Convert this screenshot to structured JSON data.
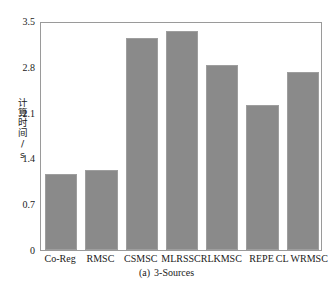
{
  "figure": {
    "caption_tag": "(a)",
    "caption_text": "3-Sources",
    "ylabel": "计算时间/s",
    "bar_color": "#8a8a8a",
    "frame_color": "#9a9a9a",
    "text_color": "#1a1a1a",
    "background": "#ffffff"
  },
  "chart_data": {
    "type": "bar",
    "title": "",
    "subtitle": "(a)  3-Sources",
    "xlabel": "",
    "ylabel": "计算时间/s",
    "ylim": [
      0,
      3.5
    ],
    "yticks": [
      0,
      0.7,
      1.4,
      2.1,
      2.8,
      3.5
    ],
    "ytick_labels": [
      "0",
      "0.7",
      "1.4",
      "2.1",
      "2.8",
      "3.5"
    ],
    "grid": false,
    "legend": false,
    "categories": [
      "Co-Reg",
      "RMSC",
      "CSMSC",
      "MLRSSC",
      "RLKMSC",
      "REPE",
      "CL WRMSC"
    ],
    "values": [
      1.16,
      1.22,
      3.24,
      3.35,
      2.83,
      2.22,
      2.72
    ],
    "series": [
      {
        "name": "计算时间/s",
        "color": "#8a8a8a",
        "values": [
          1.16,
          1.22,
          3.24,
          3.35,
          2.83,
          2.22,
          2.72
        ]
      }
    ]
  }
}
